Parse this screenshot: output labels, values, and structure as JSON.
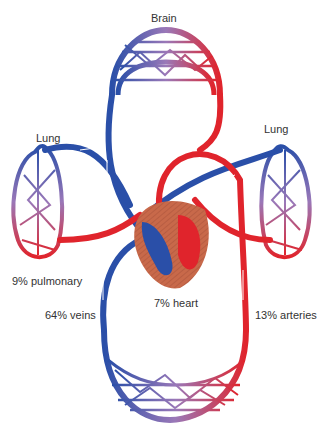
{
  "organs": {
    "brain": "Brain",
    "lung_left": "Lung",
    "lung_right": "Lung"
  },
  "percentages": {
    "pulmonary": "9% pulmonary",
    "heart": "7% heart",
    "veins": "64% veins",
    "arteries": "13% arteries"
  },
  "colors": {
    "venous": "#2a4fa8",
    "arterial": "#e0242c",
    "capillary_mix": "#9a78b8",
    "heart_muscle": "#c8694a",
    "label_text": "#333333"
  }
}
